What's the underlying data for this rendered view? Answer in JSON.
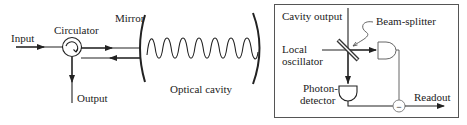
{
  "figure": {
    "left_panel": {
      "labels": {
        "input": "Input",
        "circulator": "Circulator",
        "mirror": "Mirror",
        "output": "Output",
        "cavity": "Optical cavity"
      }
    },
    "right_panel": {
      "labels": {
        "cavity_output": "Cavity output",
        "beam_splitter": "Beam-splitter",
        "local": "Local",
        "oscillator": "oscillator",
        "photon": "Photon-",
        "detector": "detector",
        "readout": "Readout",
        "subtract": "−"
      }
    },
    "colors": {
      "line": "#222222",
      "background": "#ffffff",
      "box_border": "#555555"
    }
  }
}
